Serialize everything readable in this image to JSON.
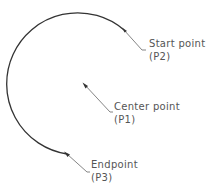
{
  "diagram": {
    "colors": {
      "arc": "#333333",
      "leader": "#777777",
      "text": "#555555",
      "background": "#ffffff"
    },
    "arc": {
      "center": [
        85,
        85
      ],
      "radius": 71,
      "start": [
        124,
        30
      ],
      "end": [
        67,
        154
      ],
      "direction": "counterclockwise"
    },
    "labels": [
      {
        "id": "start",
        "line1": "Start point",
        "line2": "(P2)",
        "anchor": [
          124,
          30
        ],
        "elbow": [
          142,
          50
        ],
        "tail": [
          146,
          50
        ],
        "text_pos": [
          149,
          47
        ]
      },
      {
        "id": "center",
        "line1": "Center point",
        "line2": "(P1)",
        "anchor": [
          84,
          84
        ],
        "elbow": [
          110,
          112
        ],
        "tail": [
          113,
          112
        ],
        "text_pos": [
          114,
          110
        ]
      },
      {
        "id": "end",
        "line1": "Endpoint",
        "line2": "(P3)",
        "anchor": [
          67,
          154
        ],
        "elbow": [
          87,
          172
        ],
        "tail": [
          90,
          172
        ],
        "text_pos": [
          91,
          168
        ]
      }
    ]
  }
}
